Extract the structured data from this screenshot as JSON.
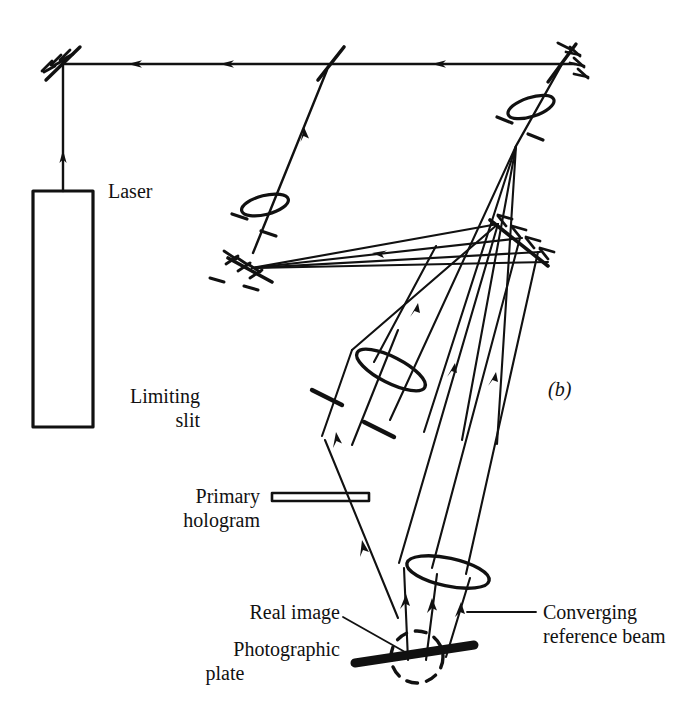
{
  "figure": {
    "panel_label": "(b)",
    "background_color": "#ffffff",
    "ink_color": "#111111",
    "width": 678,
    "height": 725
  },
  "labels": {
    "laser": "Laser",
    "limiting_slit_line1": "Limiting",
    "limiting_slit_line2": "slit",
    "primary_hologram_line1": "Primary",
    "primary_hologram_line2": "hologram",
    "real_image": "Real image",
    "photographic_plate_line1": "Photographic",
    "photographic_plate_line2": "plate",
    "converging_reference_beam_line1": "Converging",
    "converging_reference_beam_line2": "reference beam"
  },
  "components": [
    {
      "name": "laser-source",
      "label": "Laser"
    },
    {
      "name": "mirror-top-left",
      "label": ""
    },
    {
      "name": "beam-splitter",
      "label": ""
    },
    {
      "name": "mirror-top-right",
      "label": ""
    },
    {
      "name": "spatial-filter-object",
      "label": ""
    },
    {
      "name": "mirror-object-beam",
      "label": ""
    },
    {
      "name": "spatial-filter-reference",
      "label": ""
    },
    {
      "name": "mirror-reference-beam",
      "label": ""
    },
    {
      "name": "lens-object-beam",
      "label": ""
    },
    {
      "name": "limiting-slit",
      "label": "Limiting slit"
    },
    {
      "name": "primary-hologram",
      "label": "Primary hologram"
    },
    {
      "name": "lens-reference-beam",
      "label": ""
    },
    {
      "name": "real-image",
      "label": "Real image"
    },
    {
      "name": "photographic-plate",
      "label": "Photographic plate"
    },
    {
      "name": "converging-reference-beam",
      "label": "Converging reference beam"
    }
  ]
}
